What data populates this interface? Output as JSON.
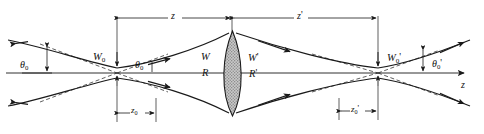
{
  "figure": {
    "axis_label": "z",
    "stroke_color": "#1a1a1a",
    "lens_fill": "#b5b5b5",
    "background": "#ffffff"
  },
  "dimensions": {
    "z": {
      "label": "z",
      "primes": "",
      "sub": ""
    },
    "z_prime": {
      "label": "z",
      "primes": "'",
      "sub": ""
    },
    "z0": {
      "label": "z",
      "sub": "0",
      "primes": ""
    },
    "z0_prime": {
      "label": "z",
      "sub": "0",
      "primes": "'"
    }
  },
  "waists": {
    "input": {
      "label": "W",
      "sub": "0",
      "primes": ""
    },
    "output": {
      "label": "W",
      "sub": "0",
      "primes": "'"
    }
  },
  "angles": {
    "theta0_left": {
      "label": "θ",
      "sub": "0",
      "primes": ""
    },
    "theta0_inner": {
      "label": "θ",
      "sub": "0",
      "primes": ""
    },
    "theta0_prime": {
      "label": "θ",
      "sub": "0",
      "primes": "'"
    }
  },
  "lens_labels": {
    "W_in": {
      "label": "W",
      "primes": ""
    },
    "R_in": {
      "label": "R",
      "primes": ""
    },
    "W_out": {
      "label": "W",
      "primes": "'"
    },
    "R_out": {
      "label": "R",
      "primes": "'"
    }
  }
}
